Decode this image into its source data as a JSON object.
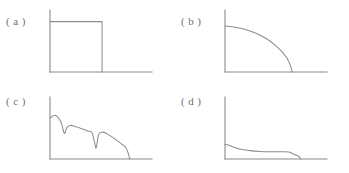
{
  "figure": {
    "background_color": "#ffffff",
    "line_color": "#8a8a8a",
    "label_color": "#706f6f",
    "width": 349,
    "height": 173
  },
  "panels": [
    {
      "id": "a",
      "label": "( a )",
      "description": "rectangular / step profile: constant high value then abrupt drop to zero"
    },
    {
      "id": "b",
      "label": "( b )",
      "description": "smooth convex decay: slow initial fall steepening to reach zero"
    },
    {
      "id": "c",
      "label": "( c )",
      "description": "sawtooth decay: descending trend interrupted by two sharp V notches, then a steep final drop"
    },
    {
      "id": "d",
      "label": "( d )",
      "description": "low rapid initial drop followed by a long near flat plateau and a small final step to zero"
    }
  ],
  "chart_data": [
    {
      "type": "line",
      "panel": "a",
      "title": "( a )",
      "xlabel": "",
      "ylabel": "",
      "xlim": [
        0,
        1
      ],
      "ylim": [
        0,
        1
      ],
      "grid": false,
      "legend": "none",
      "axes_style": "L-shaped spine, no ticks, no tick labels",
      "x": [
        0.0,
        0.62,
        0.62
      ],
      "y": [
        0.9,
        0.9,
        0.0
      ]
    },
    {
      "type": "line",
      "panel": "b",
      "title": "( b )",
      "xlabel": "",
      "ylabel": "",
      "xlim": [
        0,
        1
      ],
      "ylim": [
        0,
        1
      ],
      "grid": false,
      "legend": "none",
      "axes_style": "L-shaped spine, no ticks, no tick labels",
      "x": [
        0.0,
        0.1,
        0.2,
        0.3,
        0.4,
        0.5,
        0.6,
        0.68,
        0.74,
        0.78,
        0.8
      ],
      "y": [
        0.82,
        0.805,
        0.775,
        0.73,
        0.67,
        0.59,
        0.475,
        0.36,
        0.24,
        0.11,
        0.0
      ]
    },
    {
      "type": "line",
      "panel": "c",
      "title": "( c )",
      "xlabel": "",
      "ylabel": "",
      "xlim": [
        0,
        1
      ],
      "ylim": [
        0,
        1
      ],
      "grid": false,
      "legend": "none",
      "axes_style": "L-shaped spine, no ticks, no tick labels",
      "x": [
        0.0,
        0.06,
        0.13,
        0.17,
        0.2,
        0.24,
        0.3,
        0.38,
        0.45,
        0.5,
        0.53,
        0.55,
        0.58,
        0.63,
        0.7,
        0.78,
        0.85,
        0.9,
        0.93,
        0.95
      ],
      "y": [
        0.73,
        0.78,
        0.66,
        0.46,
        0.56,
        0.6,
        0.58,
        0.54,
        0.5,
        0.47,
        0.3,
        0.2,
        0.44,
        0.48,
        0.43,
        0.35,
        0.27,
        0.21,
        0.11,
        0.0
      ]
    },
    {
      "type": "line",
      "panel": "d",
      "title": "( d )",
      "xlabel": "",
      "ylabel": "",
      "xlim": [
        0,
        1
      ],
      "ylim": [
        0,
        1
      ],
      "grid": false,
      "legend": "none",
      "axes_style": "L-shaped spine, no ticks, no tick labels",
      "x": [
        0.0,
        0.04,
        0.12,
        0.22,
        0.32,
        0.42,
        0.52,
        0.62,
        0.7,
        0.76,
        0.8,
        0.84,
        0.88,
        0.9
      ],
      "y": [
        0.26,
        0.25,
        0.2,
        0.165,
        0.145,
        0.135,
        0.13,
        0.13,
        0.13,
        0.125,
        0.1,
        0.07,
        0.045,
        0.0
      ]
    }
  ]
}
